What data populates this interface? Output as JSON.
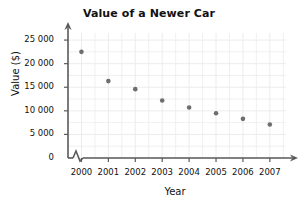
{
  "chart_data": {
    "type": "scatter",
    "title": "Value of a Newer Car",
    "xlabel": "Year",
    "ylabel": "Value ($)",
    "categories": [
      "2000",
      "2001",
      "2002",
      "2003",
      "2004",
      "2005",
      "2006",
      "2007"
    ],
    "x": [
      2000,
      2001,
      2002,
      2003,
      2004,
      2005,
      2006,
      2007
    ],
    "values": [
      22500,
      16300,
      14600,
      12200,
      10700,
      9500,
      8300,
      7100
    ],
    "series": [
      {
        "name": "Car value",
        "values": [
          22500,
          16300,
          14600,
          12200,
          10700,
          9500,
          8300,
          7100
        ]
      }
    ],
    "ylim": [
      0,
      26500
    ],
    "xlim": [
      1999.5,
      2007.6
    ],
    "ytick_values": [
      0,
      5000,
      10000,
      15000,
      20000,
      25000
    ],
    "ytick_labels": [
      "0",
      "5 000",
      "10 000",
      "15 000",
      "20 000",
      "25 000"
    ],
    "xtick_labels": [
      "2000",
      "2001",
      "2002",
      "2003",
      "2004",
      "2005",
      "2006",
      "2007"
    ],
    "grid": true,
    "legend": null,
    "axis_break_x": true,
    "marker_color": "#6e6e6e",
    "grid_color": "#ececec",
    "axis_color": "#5a5a5a",
    "text_color": "#111111",
    "background_color": "#ffffff",
    "annotations": []
  },
  "axes": {
    "y_label_text": "Value ($)",
    "x_label_text": "Year"
  }
}
